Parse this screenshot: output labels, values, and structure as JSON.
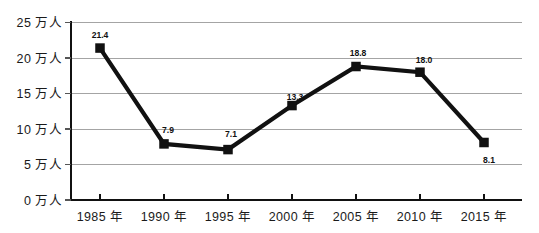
{
  "chart_data": {
    "type": "line",
    "title": "",
    "xlabel": "",
    "ylabel": "",
    "categories": [
      "1985 年",
      "1990 年",
      "1995 年",
      "2000 年",
      "2005 年",
      "2010 年",
      "2015 年"
    ],
    "values": [
      21.4,
      7.9,
      7.1,
      13.3,
      18.8,
      18.0,
      8.1
    ],
    "point_labels": [
      "21.4",
      "7.9",
      "7.1",
      "13.3",
      "18.8",
      "18.0",
      "8.1"
    ],
    "ylim": [
      0,
      25
    ],
    "ytick_values": [
      25,
      20,
      15,
      10,
      5,
      0
    ],
    "ytick_labels": [
      "25 万人",
      "20 万人",
      "15 万人",
      "10 万人",
      "5 万人",
      "0 万人"
    ],
    "unit": "万人",
    "grid": true,
    "legend": "none",
    "series_color": "#111111",
    "grid_color": "#9a9a9a",
    "axis_color": "#111111",
    "marker": "square"
  },
  "axis": {
    "y": {
      "t0": "25 万人",
      "t1": "20 万人",
      "t2": "15 万人",
      "t3": "10 万人",
      "t4": "5 万人",
      "t5": "0 万人"
    },
    "x": {
      "t0": "1985 年",
      "t1": "1990 年",
      "t2": "1995 年",
      "t3": "2000 年",
      "t4": "2005 年",
      "t5": "2010 年",
      "t6": "2015 年"
    }
  },
  "labels": {
    "p0": "21.4",
    "p1": "7.9",
    "p2": "7.1",
    "p3": "13.3",
    "p4": "18.8",
    "p5": "18.0",
    "p6": "8.1"
  }
}
